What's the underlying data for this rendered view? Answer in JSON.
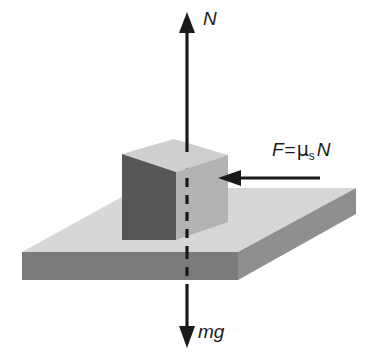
{
  "diagram": {
    "background_color": "#ffffff",
    "stroke_color": "#1a1a1a",
    "labels": {
      "normal_force": "N",
      "weight": "mg",
      "friction_force_prefix": "F",
      "friction_force_equals": "=",
      "friction_force_mu": "μ",
      "friction_force_mu_subscript": "s",
      "friction_force_normal": "N"
    },
    "colors": {
      "slab_top": "#d7d7d7",
      "slab_front": "#7b7b7b",
      "slab_right": "#8f8f8f",
      "cube_front": "#565656",
      "cube_right": "#b2b2b2",
      "cube_top": "#cfcfcf",
      "arrow": "#1a1a1a"
    },
    "arrows": {
      "normal": {
        "name": "normal-force-arrow",
        "direction": "up",
        "style": "solid",
        "label": "N"
      },
      "weight": {
        "name": "weight-force-arrow",
        "direction": "down",
        "style": "dashed-through-solid-below",
        "label": "mg"
      },
      "friction": {
        "name": "friction-force-arrow",
        "direction": "left",
        "style": "solid",
        "label": "F = μsN"
      }
    }
  }
}
